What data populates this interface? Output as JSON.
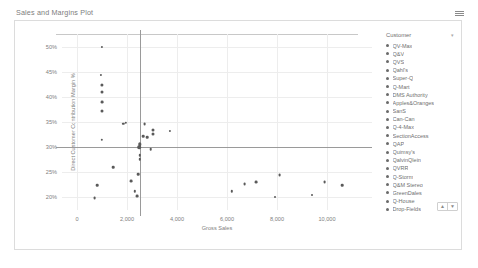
{
  "object": {
    "title": "Sales and Margins Plot",
    "menu_icon": "hamburger-menu-icon"
  },
  "legend": {
    "header": "Customer",
    "sort_icon": "sort-icon",
    "pager_up": "▲",
    "pager_down": "▼",
    "items": [
      "QV-Max",
      "Q&V",
      "QVS",
      "Qahl's",
      "Super-Q",
      "Q-Mart",
      "DMS Authority",
      "Apples&Oranges",
      "SanS",
      "Can-Can",
      "Q-4-Max",
      "SectionAccess",
      "QAP",
      "Quimsy's",
      "QalvinQlein",
      "QVRR",
      "Q-Storm",
      "Q&M Stereo",
      "GreenDales",
      "Q-House",
      "Drop-Fields"
    ]
  },
  "chart_data": {
    "type": "scatter",
    "title": "Sales and Margins Plot",
    "xlabel": "Gross Sales",
    "ylabel": "Direct Customer Contribution Margin %",
    "xlim": [
      -600,
      11800
    ],
    "ylim": [
      17.5,
      52.5
    ],
    "xticks": [
      0,
      2000,
      4000,
      6000,
      8000,
      10000
    ],
    "xticklabels": [
      "0",
      "2,000",
      "4,000",
      "6,000",
      "8,000",
      "10,000"
    ],
    "yticks": [
      20,
      25,
      30,
      35,
      40,
      45,
      50
    ],
    "yticklabels": [
      "20%",
      "25%",
      "30%",
      "35%",
      "40%",
      "45%",
      "50%"
    ],
    "grid": true,
    "legend_position": "right",
    "legend_title": "Customer",
    "reference_lines": [
      {
        "axis": "y",
        "value": 30,
        "label": "30%"
      },
      {
        "axis": "x",
        "value": 2500,
        "label": "2,500"
      }
    ],
    "series_label": "Customer",
    "points": [
      {
        "label": "QV-Max",
        "x": 1000,
        "y": 50.0,
        "size": 2.2
      },
      {
        "label": "Q&V",
        "x": 950,
        "y": 44.4,
        "size": 2.2
      },
      {
        "label": "QVS",
        "x": 1000,
        "y": 42.4,
        "size": 3.2
      },
      {
        "label": "Qahl's",
        "x": 1000,
        "y": 41.0,
        "size": 3.0
      },
      {
        "label": "Super-Q",
        "x": 1000,
        "y": 39.0,
        "size": 2.8
      },
      {
        "label": "Q-Mart",
        "x": 1000,
        "y": 37.2,
        "size": 3.0
      },
      {
        "label": "DMS Authority",
        "x": 1850,
        "y": 34.6,
        "size": 2.4
      },
      {
        "label": "Apples&Oranges",
        "x": 1950,
        "y": 34.9,
        "size": 2.4
      },
      {
        "label": "SanS",
        "x": 1000,
        "y": 31.4,
        "size": 2.4
      },
      {
        "label": "Can-Can",
        "x": 2700,
        "y": 34.6,
        "size": 2.8
      },
      {
        "label": "Q-4-Max",
        "x": 3050,
        "y": 33.4,
        "size": 3.0
      },
      {
        "label": "SectionAccess",
        "x": 3050,
        "y": 32.7,
        "size": 3.0
      },
      {
        "label": "QAP",
        "x": 3700,
        "y": 33.3,
        "size": 2.2
      },
      {
        "label": "Quimsy's",
        "x": 2650,
        "y": 32.2,
        "size": 2.6
      },
      {
        "label": "QalvinQlein",
        "x": 2800,
        "y": 32.0,
        "size": 2.6
      },
      {
        "label": "QVRR",
        "x": 2500,
        "y": 30.6,
        "size": 3.4
      },
      {
        "label": "Q-Storm",
        "x": 2480,
        "y": 30.0,
        "size": 3.6
      },
      {
        "label": "Q&M Stereo",
        "x": 2950,
        "y": 29.6,
        "size": 2.6
      },
      {
        "label": "GreenDales",
        "x": 2500,
        "y": 28.4,
        "size": 2.4
      },
      {
        "label": "Q-House",
        "x": 2520,
        "y": 27.6,
        "size": 2.4
      },
      {
        "label": "Drop-Fields",
        "x": 1450,
        "y": 26.0,
        "size": 2.6
      },
      {
        "label": "QV-Max",
        "x": 2450,
        "y": 24.6,
        "size": 2.6
      },
      {
        "label": "Q&V",
        "x": 2150,
        "y": 23.2,
        "size": 2.8
      },
      {
        "label": "QVS",
        "x": 8100,
        "y": 24.4,
        "size": 2.8
      },
      {
        "label": "Qahl's",
        "x": 9900,
        "y": 23.1,
        "size": 2.8
      },
      {
        "label": "Super-Q",
        "x": 6700,
        "y": 22.6,
        "size": 2.8
      },
      {
        "label": "Q-Mart",
        "x": 7150,
        "y": 23.0,
        "size": 2.8
      },
      {
        "label": "DMS Authority",
        "x": 10600,
        "y": 22.4,
        "size": 2.6
      },
      {
        "label": "Apples&Oranges",
        "x": 6200,
        "y": 21.2,
        "size": 2.4
      },
      {
        "label": "SanS",
        "x": 800,
        "y": 22.4,
        "size": 2.6
      },
      {
        "label": "Can-Can",
        "x": 2300,
        "y": 21.2,
        "size": 2.4
      },
      {
        "label": "Q-4-Max",
        "x": 700,
        "y": 19.8,
        "size": 2.8
      },
      {
        "label": "SectionAccess",
        "x": 2400,
        "y": 20.2,
        "size": 2.8
      },
      {
        "label": "QAP",
        "x": 7900,
        "y": 20.1,
        "size": 2.0
      },
      {
        "label": "Quimsy's",
        "x": 9400,
        "y": 20.4,
        "size": 2.0
      }
    ]
  }
}
